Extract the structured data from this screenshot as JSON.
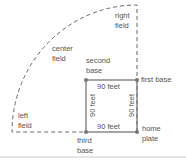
{
  "diagram": {
    "colors": {
      "line": "#777777",
      "dash": "#666666",
      "text": "#555555",
      "divider": "#cccccc"
    },
    "fields": {
      "right": [
        "right",
        "field"
      ],
      "center": [
        "center",
        "field"
      ],
      "left": [
        "left",
        "field"
      ]
    },
    "bases": {
      "second": [
        "second",
        "base"
      ],
      "first": "first base",
      "home": [
        "home",
        "plate"
      ],
      "third": [
        "third",
        "base"
      ]
    },
    "distances": {
      "top": "90 feet",
      "bottom": "90 feet",
      "left": "90 feet",
      "right": "90 feet"
    }
  }
}
